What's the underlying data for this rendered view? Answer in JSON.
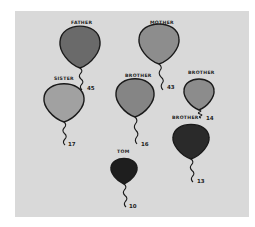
{
  "drawing": {
    "paper_color": "#d9d9d9",
    "balloons": [
      {
        "label": "FATHER",
        "number": "45",
        "fill": "#6a6a6a",
        "cx": 80,
        "cy": 44,
        "rx": 20,
        "ry": 22,
        "string_end": [
          82,
          90
        ],
        "num_pos": [
          87,
          90
        ],
        "label_pos": [
          71,
          24
        ]
      },
      {
        "label": "MOTHER",
        "number": "43",
        "fill": "#8d8d8d",
        "cx": 159,
        "cy": 41,
        "rx": 20,
        "ry": 21,
        "string_end": [
          163,
          90
        ],
        "num_pos": [
          167,
          89
        ],
        "label_pos": [
          150,
          24
        ]
      },
      {
        "label": "SISTER",
        "number": "17",
        "fill": "#a1a1a1",
        "cx": 64,
        "cy": 100,
        "rx": 20,
        "ry": 20,
        "string_end": [
          65,
          145
        ],
        "num_pos": [
          68,
          146
        ],
        "label_pos": [
          54,
          80
        ]
      },
      {
        "label": "BROTHER",
        "number": "16",
        "fill": "#858585",
        "cx": 135,
        "cy": 95,
        "rx": 19,
        "ry": 20,
        "string_end": [
          137,
          144
        ],
        "num_pos": [
          141,
          146
        ],
        "label_pos": [
          125,
          77
        ]
      },
      {
        "label": "BROTHER",
        "number": "14",
        "fill": "#8c8c8c",
        "cx": 199,
        "cy": 92,
        "rx": 15,
        "ry": 16,
        "string_end": [
          201,
          118
        ],
        "num_pos": [
          206,
          120
        ],
        "label_pos": [
          188,
          74
        ]
      },
      {
        "label": "BROTHER",
        "number": "13",
        "fill": "#2a2a2a",
        "cx": 191,
        "cy": 139,
        "rx": 18,
        "ry": 18,
        "string_end": [
          193,
          182
        ],
        "num_pos": [
          197,
          183
        ],
        "label_pos": [
          172,
          119
        ]
      },
      {
        "label": "TOM",
        "number": "10",
        "fill": "#1e1e1e",
        "cx": 124,
        "cy": 169,
        "rx": 13,
        "ry": 13,
        "string_end": [
          126,
          207
        ],
        "num_pos": [
          129,
          208
        ],
        "label_pos": [
          117,
          153
        ]
      }
    ]
  }
}
